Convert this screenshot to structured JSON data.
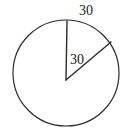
{
  "figure": {
    "type": "geometry-diagram",
    "background_color": "#ffffff",
    "stroke_color": "#2b2b2b",
    "text_color": "#1a1a1a",
    "circle": {
      "center_x": 66,
      "center_y": 73,
      "radius": 53,
      "stroke_width": 1.2,
      "fill": "none"
    },
    "radii": [
      {
        "name": "vertical-radius",
        "from_x": 66,
        "from_y": 80,
        "to_x": 67,
        "to_y": 21,
        "stroke_width": 1.4
      },
      {
        "name": "slanted-radius",
        "from_x": 66,
        "from_y": 80,
        "to_x": 111,
        "to_y": 42,
        "stroke_width": 1.4
      }
    ],
    "labels": [
      {
        "name": "arc-length-label",
        "text": "30",
        "x": 79,
        "y": 4
      },
      {
        "name": "radius-length-label",
        "text": "30",
        "x": 70,
        "y": 53
      }
    ]
  }
}
